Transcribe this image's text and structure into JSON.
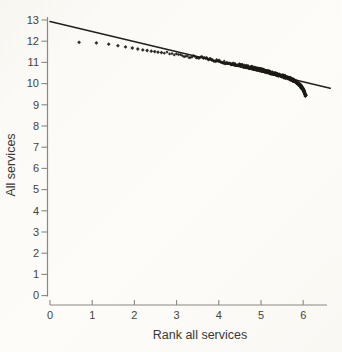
{
  "page": {
    "corner_fragment": "″ ″ ″",
    "background": "#fbfaf6",
    "ink": "#1e1b17"
  },
  "chart_data": {
    "type": "scatter",
    "title": "",
    "xlabel": "Rank all services",
    "ylabel": "All services",
    "xlim": [
      0,
      6.6
    ],
    "ylim": [
      0,
      13
    ],
    "x_ticks": [
      0,
      1,
      2,
      3,
      4,
      5,
      6
    ],
    "y_ticks": [
      0,
      1,
      2,
      3,
      4,
      5,
      6,
      7,
      8,
      9,
      10,
      11,
      12,
      13
    ],
    "grid": false,
    "legend": null,
    "axis_color": "#8a8880",
    "fit_line": {
      "x1": 0,
      "y1": 12.93,
      "x2": 6.64,
      "y2": 9.78,
      "color": "#23201c",
      "width": 1.6
    },
    "scatter": {
      "marker": "diamond",
      "color": "#1e1b17",
      "leading_points": [
        [
          0.69,
          11.95
        ],
        [
          1.1,
          11.92
        ],
        [
          1.39,
          11.86
        ],
        [
          1.61,
          11.79
        ],
        [
          1.79,
          11.73
        ],
        [
          1.95,
          11.68
        ],
        [
          2.08,
          11.63
        ],
        [
          2.2,
          11.59
        ],
        [
          2.3,
          11.56
        ],
        [
          2.4,
          11.53
        ],
        [
          2.48,
          11.51
        ],
        [
          2.56,
          11.48
        ],
        [
          2.64,
          11.46
        ]
      ],
      "band_trend": [
        [
          2.71,
          11.44
        ],
        [
          2.83,
          11.41
        ],
        [
          2.94,
          11.38
        ],
        [
          3.04,
          11.36
        ],
        [
          3.14,
          11.33
        ],
        [
          3.26,
          11.3
        ],
        [
          3.4,
          11.26
        ],
        [
          3.56,
          11.22
        ],
        [
          3.69,
          11.18
        ],
        [
          3.81,
          11.14
        ],
        [
          3.91,
          11.1
        ],
        [
          4.01,
          11.06
        ],
        [
          4.11,
          11.02
        ],
        [
          4.25,
          10.97
        ],
        [
          4.38,
          10.92
        ],
        [
          4.5,
          10.87
        ],
        [
          4.61,
          10.82
        ],
        [
          4.75,
          10.76
        ],
        [
          4.87,
          10.71
        ],
        [
          5.0,
          10.65
        ],
        [
          5.11,
          10.59
        ],
        [
          5.22,
          10.52
        ],
        [
          5.35,
          10.44
        ],
        [
          5.48,
          10.37
        ],
        [
          5.6,
          10.3
        ],
        [
          5.7,
          10.22
        ],
        [
          5.8,
          10.11
        ],
        [
          5.87,
          10.01
        ],
        [
          5.93,
          9.91
        ],
        [
          5.98,
          9.79
        ],
        [
          6.01,
          9.68
        ],
        [
          6.03,
          9.57
        ],
        [
          6.05,
          9.47
        ],
        [
          6.06,
          9.4
        ]
      ],
      "band_rank_range": [
        15,
        430
      ],
      "band_thickness": 0.07
    }
  }
}
